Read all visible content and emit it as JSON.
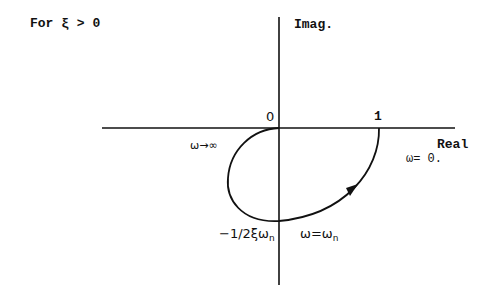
{
  "title": "For ξ > 0",
  "axes": {
    "imag_label": "Imag.",
    "real_label": "Real",
    "origin_label": "0",
    "one_label": "1"
  },
  "annotations": {
    "omega_infinity": "ω→∞",
    "omega_zero": "ω= 0.",
    "intercept_main": "−1/2ξω",
    "intercept_sub": "n",
    "omega_n_main": "ω=ω",
    "omega_n_sub": "n"
  },
  "colors": {
    "line": "#111111",
    "background": "#ffffff"
  }
}
